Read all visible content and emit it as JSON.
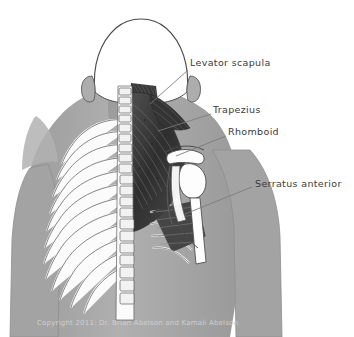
{
  "figure": {
    "background_color": "#ffffff",
    "body_fill": "#a8a8a8",
    "muscle_dark": "#3b3b3b",
    "bone_fill": "#fdfdfd",
    "outline_color": "#4a4a4a",
    "label_color": "#3a3a3a",
    "leader_color": "#7a7a7a"
  },
  "labels": [
    {
      "id": "levator-scapula",
      "text": "Levator scapula",
      "x": 190,
      "y": 63,
      "leader": {
        "x1": 188,
        "y1": 70,
        "x2": 150,
        "y2": 104
      }
    },
    {
      "id": "trapezius",
      "text": "Trapezius",
      "x": 213,
      "y": 110,
      "leader": {
        "x1": 211,
        "y1": 114,
        "x2": 158,
        "y2": 131
      }
    },
    {
      "id": "rhomboid",
      "text": "Rhomboid",
      "x": 228,
      "y": 132,
      "leader": {
        "x1": 226,
        "y1": 136,
        "x2": 176,
        "y2": 156
      }
    },
    {
      "id": "serratus-anterior",
      "text": "Serratus anterior",
      "x": 255,
      "y": 184,
      "leader": {
        "x1": 252,
        "y1": 187,
        "x2": 185,
        "y2": 214
      }
    }
  ],
  "credit": {
    "text": "Copyright 2011: Dr. Brian Abelson and Kamali Abelson"
  }
}
